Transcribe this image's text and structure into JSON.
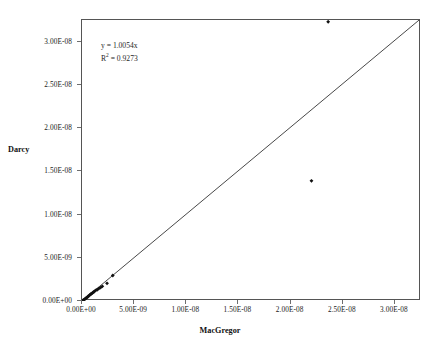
{
  "chart_data": {
    "type": "scatter",
    "title": "",
    "xlabel": "MacGregor",
    "ylabel": "Darcy",
    "xlim": [
      0,
      3.25e-08
    ],
    "ylim": [
      0,
      3.25e-08
    ],
    "grid": false,
    "legend": "none",
    "annotations": {
      "equation": "y = 1.0054x",
      "r_squared_prefix": "R",
      "r_squared_sup": "2",
      "r_squared_value": " = 0.9273",
      "slope": 1.0054,
      "r2": 0.9273
    },
    "xticks": [
      0,
      5e-09,
      1e-08,
      1.5e-08,
      2e-08,
      2.5e-08,
      3e-08
    ],
    "xticklabels": [
      "0.00E+00",
      "5.00E-09",
      "1.00E-08",
      "1.50E-08",
      "2.00E-08",
      "2.50E-08",
      "3.00E-08"
    ],
    "yticks": [
      0,
      5e-09,
      1e-08,
      1.5e-08,
      2e-08,
      2.5e-08,
      3e-08
    ],
    "yticklabels": [
      "0.00E+00",
      "5.00E-09",
      "1.00E-08",
      "1.50E-08",
      "2.00E-08",
      "2.50E-08",
      "3.00E-08"
    ],
    "trendline": {
      "type": "linear-through-origin",
      "x": [
        0,
        3.25e-08
      ],
      "y": [
        0,
        3.268e-08
      ],
      "color": "#333333"
    },
    "series": [
      {
        "name": "Darcy vs MacGregor",
        "marker": "diamond",
        "color": "#111111",
        "points": [
          [
            5e-11,
            4e-11
          ],
          [
            1.2e-10,
            1e-10
          ],
          [
            2e-10,
            1.6e-10
          ],
          [
            2.8e-10,
            2.2e-10
          ],
          [
            3.4e-10,
            3e-10
          ],
          [
            4.2e-10,
            3.6e-10
          ],
          [
            5e-10,
            4.4e-10
          ],
          [
            5.8e-10,
            5.2e-10
          ],
          [
            6.6e-10,
            6e-10
          ],
          [
            7.4e-10,
            7e-10
          ],
          [
            8.2e-10,
            7.6e-10
          ],
          [
            9e-10,
            8.6e-10
          ],
          [
            1e-09,
            9.2e-10
          ],
          [
            1.08e-09,
            1.02e-09
          ],
          [
            1.18e-09,
            1.1e-09
          ],
          [
            1.3e-09,
            1.22e-09
          ],
          [
            1.45e-09,
            1.3e-09
          ],
          [
            1.6e-09,
            1.42e-09
          ],
          [
            1.78e-09,
            1.55e-09
          ],
          [
            1.95e-09,
            1.7e-09
          ],
          [
            2.4e-09,
            2.05e-09
          ],
          [
            2.95e-09,
            2.95e-09
          ],
          [
            2.2e-08,
            1.39e-08
          ],
          [
            2.36e-08,
            3.23e-08
          ]
        ]
      }
    ]
  },
  "axis": {
    "y_title": "Darcy",
    "x_title": "MacGregor"
  }
}
